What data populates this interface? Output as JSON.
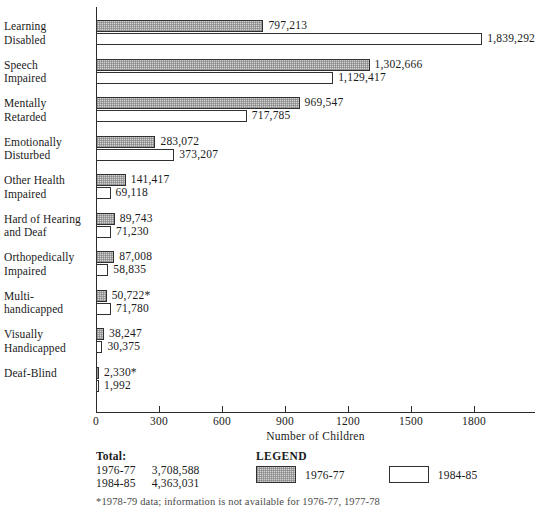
{
  "chart_data": {
    "type": "bar",
    "orientation": "horizontal",
    "title": "",
    "xlabel": "Number of Children",
    "ylabel": "",
    "xlim": [
      0,
      2085
    ],
    "xticks": [
      0,
      300,
      600,
      900,
      1200,
      1500,
      1800
    ],
    "xtick_labels": [
      "0",
      "300",
      "600",
      "900",
      "1200",
      "1500",
      "1800"
    ],
    "units_note": "values plotted in thousands along the axis",
    "grid": false,
    "legend_position": "bottom-right",
    "categories": [
      "Learning Disabled",
      "Speech Impaired",
      "Mentally Retarded",
      "Emotionally Disturbed",
      "Other Health Impaired",
      "Hard of Hearing and Deaf",
      "Orthopedically Impaired",
      "Multi-handicapped",
      "Visually Handicapped",
      "Deaf-Blind"
    ],
    "series": [
      {
        "name": "1976-77",
        "values": [
          797213,
          1302666,
          969547,
          283072,
          141417,
          89743,
          87008,
          50722,
          38247,
          2330
        ]
      },
      {
        "name": "1984-85",
        "values": [
          1839292,
          1129417,
          717785,
          373207,
          69118,
          71230,
          58835,
          71780,
          30375,
          1992
        ]
      }
    ]
  },
  "rows": [
    {
      "label_lines": [
        "Learning",
        "Disabled"
      ],
      "v1976": 797213,
      "v1984": 1839292,
      "v1976_text": "797,213",
      "v1984_text": "1,839,292"
    },
    {
      "label_lines": [
        "Speech",
        "Impaired"
      ],
      "v1976": 1302666,
      "v1984": 1129417,
      "v1976_text": "1,302,666",
      "v1984_text": "1,129,417"
    },
    {
      "label_lines": [
        "Mentally",
        "Retarded"
      ],
      "v1976": 969547,
      "v1984": 717785,
      "v1976_text": "969,547",
      "v1984_text": "717,785"
    },
    {
      "label_lines": [
        "Emotionally",
        "Disturbed"
      ],
      "v1976": 283072,
      "v1984": 373207,
      "v1976_text": "283,072",
      "v1984_text": "373,207"
    },
    {
      "label_lines": [
        "Other Health",
        "Impaired"
      ],
      "v1976": 141417,
      "v1984": 69118,
      "v1976_text": "141,417",
      "v1984_text": "69,118"
    },
    {
      "label_lines": [
        "Hard of Hearing",
        "and Deaf"
      ],
      "v1976": 89743,
      "v1984": 71230,
      "v1976_text": "89,743",
      "v1984_text": "71,230"
    },
    {
      "label_lines": [
        "Orthopedically",
        "Impaired"
      ],
      "v1976": 87008,
      "v1984": 58835,
      "v1976_text": "87,008",
      "v1984_text": "58,835"
    },
    {
      "label_lines": [
        "Multi-",
        "handicapped"
      ],
      "v1976": 50722,
      "v1984": 71780,
      "v1976_text": "50,722*",
      "v1984_text": "71,780"
    },
    {
      "label_lines": [
        "Visually",
        "Handicapped"
      ],
      "v1976": 38247,
      "v1984": 30375,
      "v1976_text": "38,247",
      "v1984_text": "30,375"
    },
    {
      "label_lines": [
        "Deaf-Blind"
      ],
      "v1976": 2330,
      "v1984": 1992,
      "v1976_text": "2,330*",
      "v1984_text": "1,992"
    }
  ],
  "axis": {
    "title": "Number of Children",
    "ticks": [
      "0",
      "300",
      "600",
      "900",
      "1200",
      "1500",
      "1800"
    ]
  },
  "totals": {
    "heading": "Total:",
    "rows": [
      {
        "year": "1976-77",
        "value": "3,708,588"
      },
      {
        "year": "1984-85",
        "value": "4,363,031"
      }
    ]
  },
  "legend": {
    "title": "LEGEND",
    "items": [
      {
        "label": "1976-77",
        "style": "hatched-gray",
        "color": "#d2d2d2"
      },
      {
        "label": "1984-85",
        "style": "white",
        "color": "#ffffff"
      }
    ]
  },
  "footnote": "*1978-79 data; information is not available for 1976-77, 1977-78"
}
